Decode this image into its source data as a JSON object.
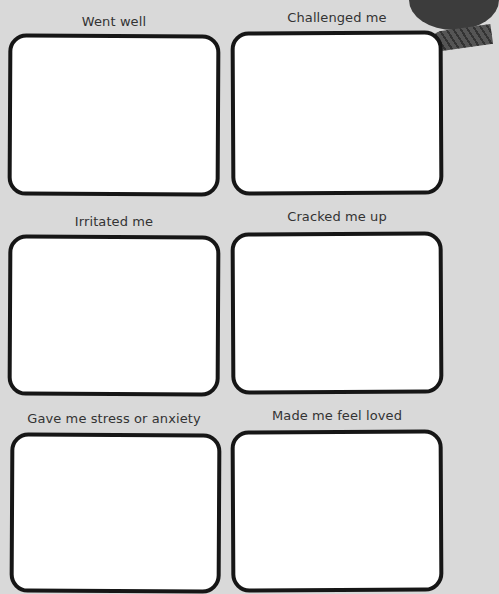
{
  "worksheet": {
    "sections": [
      {
        "label": "Went well",
        "response": ""
      },
      {
        "label": "Challenged me",
        "response": ""
      },
      {
        "label": "Irritated me",
        "response": ""
      },
      {
        "label": "Cracked me up",
        "response": ""
      },
      {
        "label": "Gave me stress or anxiety",
        "response": ""
      },
      {
        "label": "Made me feel loved",
        "response": ""
      }
    ]
  },
  "colors": {
    "background": "#d9d9d9",
    "box_border": "#161616",
    "box_fill": "#ffffff",
    "label_text": "#333333"
  }
}
